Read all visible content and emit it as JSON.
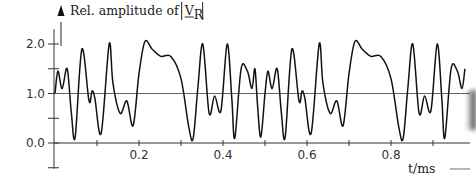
{
  "chart_data": {
    "type": "line",
    "title_parts": {
      "prefix": "Rel. amplitude of ",
      "symbol": "V",
      "subscript": "R"
    },
    "xlabel": "t/ms",
    "ylabel": "Rel. amplitude of |V_R|",
    "xlim": [
      0.0,
      0.98
    ],
    "ylim": [
      -0.5,
      2.3
    ],
    "x_ticks": [
      0.1,
      0.2,
      0.3,
      0.4,
      0.5,
      0.6,
      0.7,
      0.8,
      0.9
    ],
    "x_tick_labels": [
      "0.2",
      "0.4",
      "0.6",
      "0.8"
    ],
    "x_tick_label_values": [
      0.2,
      0.4,
      0.6,
      0.8
    ],
    "y_ticks": [
      -0.5,
      0.0,
      0.5,
      1.0,
      1.5,
      2.0
    ],
    "y_tick_labels": [
      "0.0",
      "1.0",
      "2.0"
    ],
    "y_tick_label_values": [
      0.0,
      1.0,
      2.0
    ],
    "reference_line": {
      "y": 1.0
    },
    "grid": false,
    "legend": null,
    "period_ms": 0.5,
    "series": [
      {
        "name": "|V_R| relative amplitude",
        "x": [
          0.0,
          0.007,
          0.017,
          0.029,
          0.039,
          0.048,
          0.064,
          0.081,
          0.088,
          0.095,
          0.11,
          0.129,
          0.138,
          0.155,
          0.171,
          0.186,
          0.2,
          0.214,
          0.231,
          0.252,
          0.276,
          0.3,
          0.319,
          0.329,
          0.34,
          0.352,
          0.367,
          0.38,
          0.395,
          0.41,
          0.421,
          0.428,
          0.443,
          0.458,
          0.469,
          0.476,
          0.482,
          0.49,
          0.5,
          0.507,
          0.517,
          0.529,
          0.539,
          0.548,
          0.564,
          0.581,
          0.588,
          0.595,
          0.61,
          0.629,
          0.638,
          0.655,
          0.671,
          0.686,
          0.7,
          0.714,
          0.731,
          0.752,
          0.776,
          0.8,
          0.819,
          0.829,
          0.84,
          0.852,
          0.867,
          0.88,
          0.895,
          0.91,
          0.921,
          0.928,
          0.943,
          0.958,
          0.969,
          0.976
        ],
        "y": [
          1.0,
          1.45,
          1.1,
          1.5,
          0.6,
          0.12,
          1.9,
          0.85,
          1.05,
          0.9,
          0.2,
          2.0,
          1.2,
          0.6,
          0.85,
          0.35,
          1.4,
          2.05,
          1.9,
          1.75,
          1.75,
          1.3,
          0.3,
          0.1,
          1.1,
          2.0,
          0.6,
          0.95,
          0.65,
          2.0,
          0.9,
          0.1,
          1.5,
          1.45,
          1.1,
          1.5,
          0.8,
          0.12,
          1.0,
          1.45,
          1.1,
          1.5,
          0.6,
          0.12,
          1.9,
          0.85,
          1.05,
          0.9,
          0.2,
          2.0,
          1.2,
          0.6,
          0.85,
          0.35,
          1.4,
          2.05,
          1.9,
          1.75,
          1.75,
          1.3,
          0.3,
          0.1,
          1.1,
          2.0,
          0.6,
          0.95,
          0.65,
          2.0,
          0.9,
          0.1,
          1.5,
          1.45,
          1.1,
          1.5
        ]
      }
    ]
  },
  "colors": {
    "curve": "#111111",
    "axis": "#333333",
    "reference_line": "#666666",
    "background": "#ffffff"
  }
}
